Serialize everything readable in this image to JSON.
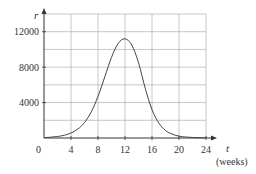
{
  "chart_data": {
    "type": "line",
    "title": "",
    "xlabel": "t",
    "xlabel_unit": "(weeks)",
    "ylabel": "r",
    "xlim": [
      0,
      24
    ],
    "ylim": [
      0,
      14000
    ],
    "grid": true,
    "legend": null,
    "x_ticks": [
      4,
      8,
      12,
      16,
      20,
      24
    ],
    "x_tick_labels": [
      "4",
      "8",
      "12",
      "16",
      "20",
      "24"
    ],
    "y_ticks": [
      4000,
      8000,
      12000
    ],
    "y_tick_labels": [
      "4000",
      "8000",
      "12000"
    ],
    "origin_label": "0",
    "x_grid_step": 4,
    "y_grid_step": 2000,
    "series": [
      {
        "name": "r(t)",
        "x": [
          0,
          1,
          2,
          3,
          4,
          5,
          6,
          7,
          8,
          9,
          10,
          11,
          12,
          13,
          14,
          15,
          16,
          17,
          18,
          19,
          20,
          21,
          22,
          23,
          24
        ],
        "values": [
          50,
          90,
          170,
          310,
          560,
          1000,
          1750,
          2950,
          4700,
          6900,
          9100,
          10700,
          11200,
          10500,
          8500,
          5600,
          3200,
          1700,
          850,
          430,
          210,
          110,
          60,
          30,
          20
        ]
      }
    ]
  },
  "colors": {
    "grid": "#b8b8b8",
    "axis": "#333333",
    "curve": "#444444",
    "background": "#ffffff"
  }
}
